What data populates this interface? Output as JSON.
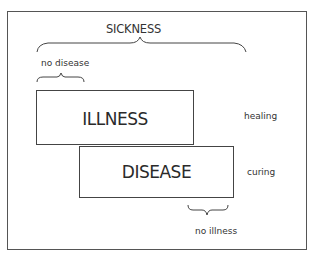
{
  "diagram": {
    "title": "SICKNESS",
    "boxes": {
      "illness": {
        "label": "ILLNESS",
        "side_label": "healing"
      },
      "disease": {
        "label": "DISEASE",
        "side_label": "curing"
      }
    },
    "braces": {
      "sickness": {
        "label": "SICKNESS",
        "spans": [
          "ILLNESS",
          "DISEASE"
        ]
      },
      "no_disease": {
        "label": "no disease",
        "spans": [
          "ILLNESS only"
        ]
      },
      "no_illness": {
        "label": "no illness",
        "spans": [
          "DISEASE only"
        ]
      }
    },
    "colors": {
      "stroke": "#444444",
      "text": "#2b2b2b",
      "background": "#ffffff"
    }
  }
}
